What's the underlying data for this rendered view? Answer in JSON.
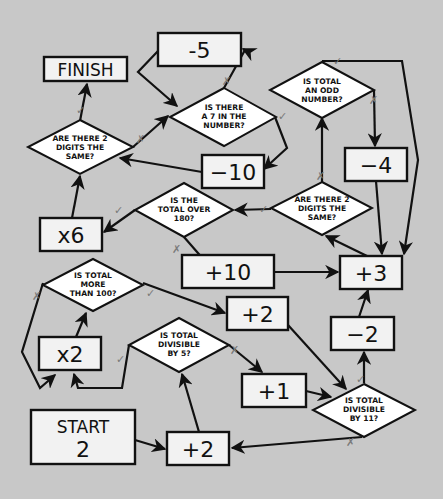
{
  "diagram": {
    "type": "number-maze-flowchart",
    "colors": {
      "background": "#c8c8c8",
      "box_fill": "#f2f2f2",
      "diamond_fill": "#ffffff",
      "stroke": "#111111",
      "mark": "#808080"
    },
    "start": {
      "label": "START",
      "value": "2"
    },
    "finish": {
      "label": "FINISH"
    },
    "operations": {
      "minus5": "-5",
      "minus10": "−10",
      "minus4": "−4",
      "times6": "x6",
      "plus10": "+10",
      "plus3": "+3",
      "plus2_upper": "+2",
      "times2": "x2",
      "minus2": "−2",
      "plus1": "+1",
      "plus2_lower": "+2"
    },
    "questions": {
      "seven_in_number": [
        "IS THERE",
        "A 7 IN THE",
        "NUMBER?"
      ],
      "odd_number": [
        "IS TOTAL",
        "AN ODD",
        "NUMBER?"
      ],
      "two_digits_same_left": [
        "ARE THERE 2",
        "DIGITS THE",
        "SAME?"
      ],
      "over_180": [
        "IS THE",
        "TOTAL OVER",
        "180?"
      ],
      "two_digits_same_right": [
        "ARE THERE 2",
        "DIGITS THE",
        "SAME?"
      ],
      "more_than_100": [
        "IS TOTAL",
        "MORE",
        "THAN 100?"
      ],
      "divisible_by_5": [
        "IS TOTAL",
        "DIVISIBLE",
        "BY 5?"
      ],
      "divisible_by_11": [
        "IS TOTAL",
        "DIVISIBLE",
        "BY 11?"
      ]
    },
    "marks": {
      "yes": "✓",
      "no": "✗"
    },
    "flow": [
      {
        "from": "START",
        "to": "+2 (lower)"
      },
      {
        "from": "+2 (lower)",
        "to": "IS TOTAL DIVISIBLE BY 5?"
      },
      {
        "from": "IS TOTAL DIVISIBLE BY 5?",
        "answer": "yes",
        "to": "x2"
      },
      {
        "from": "IS TOTAL DIVISIBLE BY 5?",
        "answer": "no",
        "to": "+1"
      },
      {
        "from": "x2",
        "to": "IS TOTAL MORE THAN 100?"
      },
      {
        "from": "IS TOTAL MORE THAN 100?",
        "answer": "yes",
        "to": "+2 (upper)"
      },
      {
        "from": "IS TOTAL MORE THAN 100?",
        "answer": "no",
        "to": "x2"
      },
      {
        "from": "+2 (upper)",
        "to": "IS TOTAL DIVISIBLE BY 11?"
      },
      {
        "from": "+1",
        "to": "IS TOTAL DIVISIBLE BY 11?"
      },
      {
        "from": "IS TOTAL DIVISIBLE BY 11?",
        "answer": "yes",
        "to": "−2"
      },
      {
        "from": "IS TOTAL DIVISIBLE BY 11?",
        "answer": "no",
        "to": "+2 (lower)"
      },
      {
        "from": "−2",
        "to": "+3"
      },
      {
        "from": "+10",
        "to": "+3"
      },
      {
        "from": "+3",
        "to": "ARE THERE 2 DIGITS THE SAME? (right)"
      },
      {
        "from": "ARE THERE 2 DIGITS THE SAME? (right)",
        "answer": "yes",
        "to": "IS THE TOTAL OVER 180?"
      },
      {
        "from": "ARE THERE 2 DIGITS THE SAME? (right)",
        "answer": "no",
        "to": "IS TOTAL AN ODD NUMBER?"
      },
      {
        "from": "IS THE TOTAL OVER 180?",
        "answer": "yes",
        "to": "x6"
      },
      {
        "from": "IS THE TOTAL OVER 180?",
        "answer": "no",
        "to": "+10"
      },
      {
        "from": "IS TOTAL AN ODD NUMBER?",
        "answer": "yes",
        "to": "+3"
      },
      {
        "from": "IS TOTAL AN ODD NUMBER?",
        "answer": "no",
        "to": "−4"
      },
      {
        "from": "−4",
        "to": "+3"
      },
      {
        "from": "x6",
        "to": "ARE THERE 2 DIGITS THE SAME? (left)"
      },
      {
        "from": "ARE THERE 2 DIGITS THE SAME? (left)",
        "answer": "yes",
        "to": "FINISH"
      },
      {
        "from": "ARE THERE 2 DIGITS THE SAME? (left)",
        "answer": "no",
        "to": "IS THERE A 7 IN THE NUMBER?"
      },
      {
        "from": "IS THERE A 7 IN THE NUMBER?",
        "answer": "yes",
        "to": "−10"
      },
      {
        "from": "IS THERE A 7 IN THE NUMBER?",
        "answer": "no",
        "to": "-5"
      },
      {
        "from": "-5",
        "to": "IS THERE A 7 IN THE NUMBER?"
      },
      {
        "from": "−10",
        "to": "ARE THERE 2 DIGITS THE SAME? (left)"
      }
    ]
  }
}
